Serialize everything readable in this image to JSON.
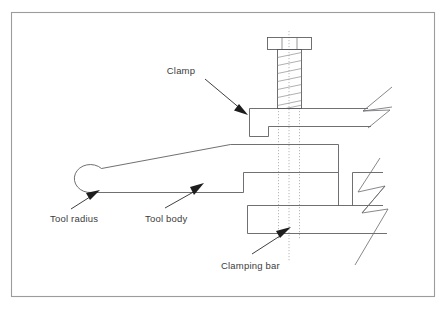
{
  "figure": {
    "type": "engineering-cross-section",
    "background_color": "#ffffff",
    "frame": {
      "color": "#9c9c9c",
      "x": 11,
      "y": 12,
      "width": 424,
      "height": 285
    },
    "line_color": "#56565a",
    "text_color": "#3c3c3c",
    "arrow_color": "#1d1d1d",
    "centerline_color": "#9a9a9e"
  },
  "labels": {
    "clamp": "Clamp",
    "tool_radius": "Tool radius",
    "tool_body": "Tool body",
    "clamping_bar": "Clamping bar"
  },
  "parts": [
    {
      "id": "bolt",
      "name": "Clamping screw with hex head and threaded shank",
      "head_segments": 3
    },
    {
      "id": "clamp",
      "name": "Clamp — stepped bar pressed down by the screw, broken off at right"
    },
    {
      "id": "tool",
      "name": "Tool body with rounded nose (tool radius) at left, stepped at right"
    },
    {
      "id": "clamping-bar",
      "name": "Clamping bar supporting the tool, broken off at right"
    }
  ],
  "leaders": [
    {
      "label": "Clamp",
      "points_to": "clamp top face"
    },
    {
      "label": "Tool radius",
      "points_to": "rounded nose of tool"
    },
    {
      "label": "Tool body",
      "points_to": "lower flank of tool body"
    },
    {
      "label": "Clamping bar",
      "points_to": "clamping bar body"
    }
  ]
}
